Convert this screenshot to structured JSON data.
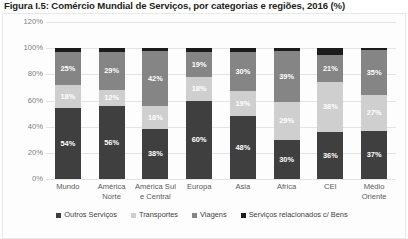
{
  "figure": {
    "title": "Figura I.5: Comércio Mundial de Serviços, por categorias e regiões, 2016 (%)"
  },
  "chart_data": {
    "type": "bar",
    "subtype": "100% stacked column",
    "title": "Figura I.5: Comércio Mundial de Serviços, por categorias e regiões, 2016 (%)",
    "xlabel": "",
    "ylabel": "",
    "ylim": [
      0,
      120
    ],
    "ytick_labels": [
      "0%",
      "20%",
      "40%",
      "60%",
      "80%",
      "100%",
      "120%"
    ],
    "ytick_values": [
      0,
      20,
      40,
      60,
      80,
      100,
      120
    ],
    "grid": true,
    "legend_position": "bottom",
    "categories": [
      "Mundo",
      "América Norte",
      "América Sul e Central",
      "Europa",
      "Asia",
      "Africa",
      "CEI",
      "Médio Oriente"
    ],
    "category_lines": [
      [
        "Mundo",
        ""
      ],
      [
        "América",
        "Norte"
      ],
      [
        "América Sul",
        "e Central"
      ],
      [
        "Europa",
        ""
      ],
      [
        "Asia",
        ""
      ],
      [
        "Africa",
        ""
      ],
      [
        "CEI",
        ""
      ],
      [
        "Médio",
        "Oriente"
      ]
    ],
    "series": [
      {
        "name": "Outros Serviços",
        "color": "#3f3f3f",
        "values": [
          54,
          56,
          38,
          60,
          48,
          30,
          36,
          37
        ],
        "labels": [
          "54%",
          "56%",
          "38%",
          "60%",
          "48%",
          "30%",
          "36%",
          "37%"
        ]
      },
      {
        "name": "Transportes",
        "color": "#cfcfcf",
        "values": [
          18,
          12,
          18,
          18,
          19,
          29,
          38,
          27
        ],
        "labels": [
          "18%",
          "12%",
          "18%",
          "18%",
          "19%",
          "29%",
          "38%",
          "27%"
        ]
      },
      {
        "name": "Viagens",
        "color": "#858585",
        "values": [
          25,
          29,
          42,
          19,
          30,
          39,
          21,
          35
        ],
        "labels": [
          "25%",
          "29%",
          "42%",
          "19%",
          "30%",
          "39%",
          "21%",
          "35%"
        ]
      },
      {
        "name": "Serviços relacionados c/ Bens",
        "color": "#1c1c1c",
        "values": [
          3,
          3,
          2,
          3,
          3,
          2,
          5,
          1
        ],
        "labels": [
          "",
          "",
          "",
          "",
          "",
          "",
          "",
          ""
        ]
      }
    ]
  }
}
